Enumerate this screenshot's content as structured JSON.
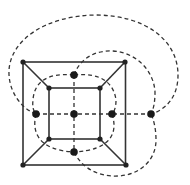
{
  "diagram": {
    "colors": {
      "line": "#333333",
      "vertex": "#1a1a1a",
      "background": "#ffffff"
    },
    "primal": {
      "vertices": [
        {
          "id": "o_tl",
          "x": 23,
          "y": 62
        },
        {
          "id": "o_tr",
          "x": 125,
          "y": 62
        },
        {
          "id": "o_br",
          "x": 126,
          "y": 165
        },
        {
          "id": "o_bl",
          "x": 23,
          "y": 165
        },
        {
          "id": "i_tl",
          "x": 49,
          "y": 88
        },
        {
          "id": "i_tr",
          "x": 100,
          "y": 88
        },
        {
          "id": "i_br",
          "x": 100,
          "y": 139
        },
        {
          "id": "i_bl",
          "x": 49,
          "y": 139
        }
      ],
      "edges": [
        [
          "o_tl",
          "o_tr"
        ],
        [
          "o_tr",
          "o_br"
        ],
        [
          "o_br",
          "o_bl"
        ],
        [
          "o_bl",
          "o_tl"
        ],
        [
          "i_tl",
          "i_tr"
        ],
        [
          "i_tr",
          "i_br"
        ],
        [
          "i_br",
          "i_bl"
        ],
        [
          "i_bl",
          "i_tl"
        ],
        [
          "o_tl",
          "i_tl"
        ],
        [
          "o_tr",
          "i_tr"
        ],
        [
          "o_br",
          "i_br"
        ],
        [
          "o_bl",
          "i_bl"
        ]
      ]
    },
    "dual": {
      "vertices": [
        {
          "id": "d_left",
          "x": 36,
          "y": 114
        },
        {
          "id": "d_center",
          "x": 74,
          "y": 114
        },
        {
          "id": "d_right",
          "x": 112,
          "y": 114
        },
        {
          "id": "d_outer",
          "x": 151,
          "y": 114
        },
        {
          "id": "d_top",
          "x": 74,
          "y": 75
        },
        {
          "id": "d_bottom",
          "x": 74,
          "y": 152
        }
      ],
      "edges": [
        [
          "d_left",
          "d_center"
        ],
        [
          "d_center",
          "d_right"
        ],
        [
          "d_right",
          "d_outer"
        ],
        [
          "d_top",
          "d_center"
        ],
        [
          "d_center",
          "d_bottom"
        ],
        [
          "d_top",
          "d_left"
        ],
        [
          "d_left",
          "d_bottom"
        ],
        [
          "d_top",
          "d_right"
        ],
        [
          "d_right",
          "d_bottom"
        ],
        [
          "d_left",
          "d_outer"
        ],
        [
          "d_top",
          "d_outer"
        ],
        [
          "d_bottom",
          "d_outer"
        ]
      ]
    }
  }
}
